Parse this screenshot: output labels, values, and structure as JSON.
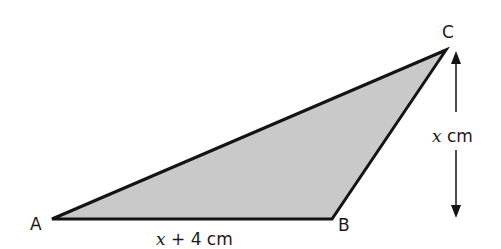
{
  "figure": {
    "type": "triangle",
    "fill_color": "#c9c9c9",
    "stroke_color": "#141414",
    "vertices": [
      {
        "label": "A",
        "x": 52,
        "y": 219
      },
      {
        "label": "B",
        "x": 332,
        "y": 219
      },
      {
        "label": "C",
        "x": 446,
        "y": 50
      }
    ],
    "base": {
      "from": "A",
      "to": "B",
      "label_var": "x",
      "label_rest": " + 4 cm"
    },
    "height": {
      "description": "perpendicular height from C to line AB",
      "label_var": "x",
      "label_rest": " cm",
      "arrow": "double-headed vertical"
    }
  }
}
